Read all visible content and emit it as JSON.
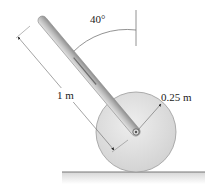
{
  "diagram": {
    "type": "mechanics-free-body-setup",
    "elements": {
      "rod": {
        "label": "rod",
        "length_label": "1 m"
      },
      "disk": {
        "label": "disk",
        "radius_label": "0.25 m"
      },
      "angle": {
        "label": "40°",
        "reference": "vertical"
      },
      "ground": {
        "label": "ground"
      }
    },
    "labels": {
      "rod_length": "1 m",
      "disk_radius": "0.25 m",
      "angle": "40°"
    },
    "colors": {
      "rod_fill": "#b8b8b8",
      "rod_edge": "#8a8a8a",
      "disk_fill": "#dcdcdc",
      "disk_edge": "#9a9a9a",
      "ground_line": "#777777",
      "dimension_line": "#555555",
      "text": "#222222"
    }
  }
}
